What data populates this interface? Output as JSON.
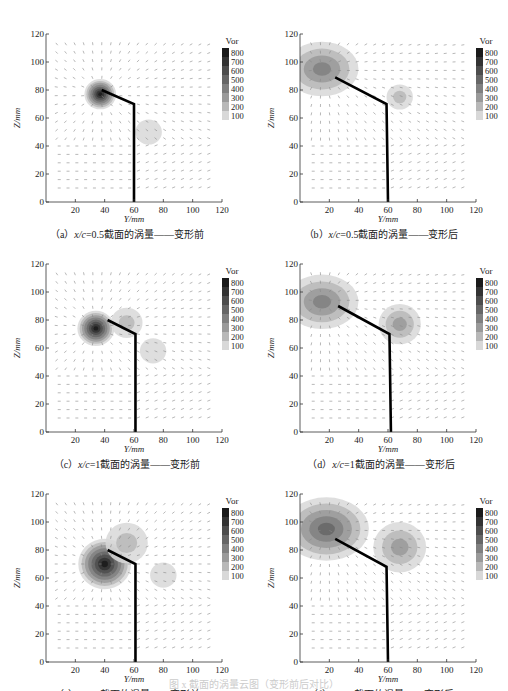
{
  "figure": {
    "bottom_caption": "图 x 截面的涡量云图（变形前后对比）"
  },
  "legend": {
    "title": "Vor",
    "levels": [
      "800",
      "700",
      "600",
      "500",
      "400",
      "300",
      "200",
      "100"
    ],
    "colors": [
      "#1a1a1a",
      "#333333",
      "#4d4d4d",
      "#666666",
      "#808080",
      "#9a9a9a",
      "#b8b8b8",
      "#d8d8d8"
    ]
  },
  "axes": {
    "xlabel": "Y/mm",
    "ylabel": "Z/mm",
    "xticks": [
      "20",
      "40",
      "60",
      "80",
      "100",
      "120"
    ],
    "yticks": [
      "0",
      "20",
      "40",
      "60",
      "80",
      "100",
      "120"
    ]
  },
  "panels": [
    {
      "id": "a",
      "label": "（a）",
      "xc": "x/c",
      "eq": "=0.5",
      "desc": "截面的涡量——变形前",
      "state": "before"
    },
    {
      "id": "b",
      "label": "（b）",
      "xc": "x/c",
      "eq": "=0.5",
      "desc": "截面的涡量——变形后",
      "state": "after"
    },
    {
      "id": "c",
      "label": "（c）",
      "xc": "x/c",
      "eq": "=1",
      "desc": "截面的涡量——变形前",
      "state": "before"
    },
    {
      "id": "d",
      "label": "（d）",
      "xc": "x/c",
      "eq": "=1",
      "desc": "截面的涡量——变形后",
      "state": "after"
    },
    {
      "id": "e",
      "label": "（e）",
      "xc": "x/c",
      "eq": "=2",
      "desc": "截面的涡量——变形前",
      "state": "before"
    },
    {
      "id": "f",
      "label": "（f）",
      "xc": "x/c",
      "eq": "=2",
      "desc": "截面的涡量——变形后",
      "state": "after"
    }
  ],
  "chart_data": [
    {
      "type": "heatmap",
      "title": "(a) x/c=0.5截面的涡量——变形前",
      "xlabel": "Y/mm",
      "ylabel": "Z/mm",
      "xlim": [
        0,
        120
      ],
      "ylim": [
        0,
        120
      ],
      "colorbar": {
        "title": "Vor",
        "levels": [
          100,
          200,
          300,
          400,
          500,
          600,
          700,
          800
        ]
      },
      "geometry": [
        [
          60,
          0
        ],
        [
          60,
          70
        ],
        [
          38,
          80
        ]
      ],
      "vortex_cores": [
        {
          "y": 37,
          "z": 77,
          "peak_vor": 800,
          "radius": 6
        },
        {
          "y": 70,
          "z": 50,
          "peak_vor": 150,
          "radius": 5
        }
      ]
    },
    {
      "type": "heatmap",
      "title": "(b) x/c=0.5截面的涡量——变形后",
      "xlabel": "Y/mm",
      "ylabel": "Z/mm",
      "xlim": [
        0,
        120
      ],
      "ylim": [
        0,
        120
      ],
      "colorbar": {
        "title": "Vor",
        "levels": [
          100,
          200,
          300,
          400,
          500,
          600,
          700,
          800
        ]
      },
      "geometry": [
        [
          60,
          0
        ],
        [
          59,
          70
        ],
        [
          24,
          89
        ]
      ],
      "vortex_cores": [
        {
          "y": 15,
          "z": 95,
          "peak_vor": 400,
          "radius": 12
        },
        {
          "y": 68,
          "z": 75,
          "peak_vor": 200,
          "radius": 5
        }
      ]
    },
    {
      "type": "heatmap",
      "title": "(c) x/c=1截面的涡量——变形前",
      "xlabel": "Y/mm",
      "ylabel": "Z/mm",
      "xlim": [
        0,
        120
      ],
      "ylim": [
        0,
        120
      ],
      "colorbar": {
        "title": "Vor",
        "levels": [
          100,
          200,
          300,
          400,
          500,
          600,
          700,
          800
        ]
      },
      "geometry": [
        [
          61,
          0
        ],
        [
          61,
          70
        ],
        [
          42,
          80
        ]
      ],
      "vortex_cores": [
        {
          "y": 34,
          "z": 74,
          "peak_vor": 800,
          "radius": 7
        },
        {
          "y": 55,
          "z": 78,
          "peak_vor": 250,
          "radius": 6
        },
        {
          "y": 73,
          "z": 58,
          "peak_vor": 150,
          "radius": 5
        }
      ]
    },
    {
      "type": "heatmap",
      "title": "(d) x/c=1截面的涡量——变形后",
      "xlabel": "Y/mm",
      "ylabel": "Z/mm",
      "xlim": [
        0,
        120
      ],
      "ylim": [
        0,
        120
      ],
      "colorbar": {
        "title": "Vor",
        "levels": [
          100,
          200,
          300,
          400,
          500,
          600,
          700,
          800
        ]
      },
      "geometry": [
        [
          62,
          0
        ],
        [
          61,
          70
        ],
        [
          26,
          90
        ]
      ],
      "vortex_cores": [
        {
          "y": 15,
          "z": 93,
          "peak_vor": 450,
          "radius": 12
        },
        {
          "y": 68,
          "z": 77,
          "peak_vor": 300,
          "radius": 8
        }
      ]
    },
    {
      "type": "heatmap",
      "title": "(e) x/c=2截面的涡量——变形前",
      "xlabel": "Y/mm",
      "ylabel": "Z/mm",
      "xlim": [
        0,
        120
      ],
      "ylim": [
        0,
        120
      ],
      "colorbar": {
        "title": "Vor",
        "levels": [
          100,
          200,
          300,
          400,
          500,
          600,
          700,
          800
        ]
      },
      "geometry": [
        [
          61,
          0
        ],
        [
          61,
          70
        ],
        [
          42,
          80
        ]
      ],
      "vortex_cores": [
        {
          "y": 40,
          "z": 70,
          "peak_vor": 800,
          "radius": 10
        },
        {
          "y": 55,
          "z": 85,
          "peak_vor": 250,
          "radius": 8
        },
        {
          "y": 80,
          "z": 62,
          "peak_vor": 150,
          "radius": 5
        }
      ]
    },
    {
      "type": "heatmap",
      "title": "(f) x/c=2截面的涡量——变形后",
      "xlabel": "Y/mm",
      "ylabel": "Z/mm",
      "xlim": [
        0,
        120
      ],
      "ylim": [
        0,
        120
      ],
      "colorbar": {
        "title": "Vor",
        "levels": [
          100,
          200,
          300,
          400,
          500,
          600,
          700,
          800
        ]
      },
      "geometry": [
        [
          60,
          0
        ],
        [
          59,
          68
        ],
        [
          24,
          88
        ]
      ],
      "vortex_cores": [
        {
          "y": 18,
          "z": 95,
          "peak_vor": 500,
          "radius": 14
        },
        {
          "y": 68,
          "z": 82,
          "peak_vor": 350,
          "radius": 10
        }
      ]
    }
  ]
}
